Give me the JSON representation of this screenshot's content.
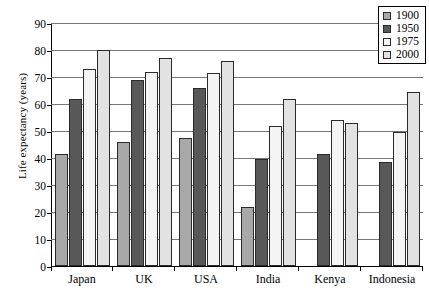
{
  "chart_data": {
    "type": "bar",
    "title": "",
    "xlabel": "",
    "ylabel": "Life expectancy (years)",
    "ylim": [
      0,
      90
    ],
    "yticks": [
      0,
      10,
      20,
      30,
      40,
      50,
      60,
      70,
      80,
      90
    ],
    "grid": true,
    "legend_position": "top-right",
    "categories": [
      "Japan",
      "UK",
      "USA",
      "India",
      "Kenya",
      "Indonesia"
    ],
    "series": [
      {
        "name": "1900",
        "color": "#a8a8a8",
        "values": [
          41.5,
          46,
          47.5,
          22,
          null,
          null
        ]
      },
      {
        "name": "1950",
        "color": "#585858",
        "values": [
          62,
          69,
          66,
          39.5,
          41.5,
          38.5
        ]
      },
      {
        "name": "1975",
        "color": "#f4f4f4",
        "values": [
          73,
          72,
          71.5,
          52,
          54,
          49.5
        ]
      },
      {
        "name": "2000",
        "color": "#e2e2e2",
        "values": [
          80,
          77,
          76,
          62,
          53,
          64.5
        ]
      }
    ]
  },
  "legend": {
    "items": [
      {
        "label": "1900"
      },
      {
        "label": "1950"
      },
      {
        "label": "1975"
      },
      {
        "label": "2000"
      }
    ]
  }
}
